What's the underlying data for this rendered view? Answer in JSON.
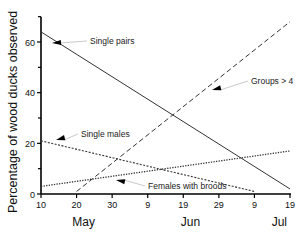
{
  "chart_data": {
    "type": "line",
    "title": "",
    "xlabel": "",
    "ylabel": "Percentage of wood ducks observed",
    "ylim": [
      0,
      70
    ],
    "xlim_days_from_may10": [
      0,
      70
    ],
    "grid": false,
    "legend_position": "inline annotations with arrows",
    "y_ticks": [
      {
        "value": 0,
        "label": "0"
      },
      {
        "value": 20,
        "label": "20"
      },
      {
        "value": 40,
        "label": "40"
      },
      {
        "value": 60,
        "label": "60"
      }
    ],
    "y_minor_ticks": [
      10,
      30,
      50,
      70
    ],
    "x_ticks": [
      {
        "day": 0,
        "label": "10"
      },
      {
        "day": 10,
        "label": "20"
      },
      {
        "day": 20,
        "label": "30"
      },
      {
        "day": 30,
        "label": "9"
      },
      {
        "day": 40,
        "label": "19"
      },
      {
        "day": 50,
        "label": "29"
      },
      {
        "day": 60,
        "label": "9"
      },
      {
        "day": 70,
        "label": "19"
      }
    ],
    "month_labels": [
      {
        "label": "May",
        "day": 12
      },
      {
        "label": "Jun",
        "day": 42
      },
      {
        "label": "Jul",
        "day": 67
      }
    ],
    "series": [
      {
        "name": "Single pairs",
        "style": "solid",
        "x_days": [
          0,
          70
        ],
        "values": [
          64,
          2
        ],
        "annotation": {
          "text": "Single pairs",
          "text_x": 90,
          "text_y": 44,
          "arrow_to": [
            52,
            43
          ]
        }
      },
      {
        "name": "Groups > 4",
        "style": "dashed",
        "x_days": [
          10,
          70
        ],
        "values": [
          1,
          68
        ],
        "annotation": {
          "text": "Groups > 4",
          "text_x": 251,
          "text_y": 84,
          "arrow_to": [
            212,
            90
          ]
        }
      },
      {
        "name": "Single males",
        "style": "dotted-dense",
        "x_days": [
          0,
          60
        ],
        "values": [
          21,
          1
        ],
        "annotation": {
          "text": "Single males",
          "text_x": 81,
          "text_y": 137,
          "arrow_to": [
            56,
            140
          ]
        }
      },
      {
        "name": "Females with broods",
        "style": "dotted",
        "x_days": [
          0,
          70
        ],
        "values": [
          3,
          17
        ],
        "annotation": {
          "text": "Females with broods",
          "text_x": 148,
          "text_y": 189,
          "arrow_to": [
            116,
            180
          ]
        }
      }
    ]
  }
}
